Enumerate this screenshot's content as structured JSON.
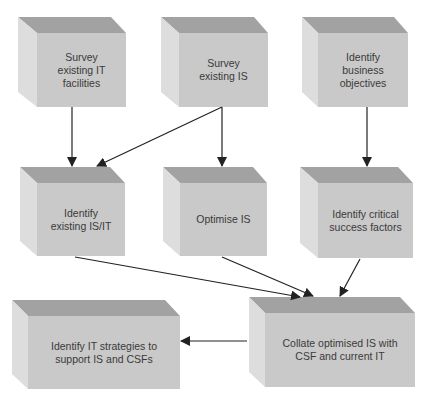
{
  "diagram": {
    "type": "flowchart",
    "style": {
      "top_face": "#a2a2a2",
      "left_face": "#dddddd",
      "front_face": "#c9c9c9",
      "arrow_color": "#222222",
      "text_color": "#3a3a3a"
    },
    "nodes": [
      {
        "id": "survey-it",
        "label": "Survey\nexisting IT\nfacilities",
        "row": 1,
        "col": 1
      },
      {
        "id": "survey-is",
        "label": "Survey\nexisting IS",
        "row": 1,
        "col": 2
      },
      {
        "id": "identify-objectives",
        "label": "Identify\nbusiness\nobjectives",
        "row": 1,
        "col": 3
      },
      {
        "id": "identify-existing",
        "label": "Identify\nexisting IS/IT",
        "row": 2,
        "col": 1
      },
      {
        "id": "optimise-is",
        "label": "Optimise IS",
        "row": 2,
        "col": 2
      },
      {
        "id": "identify-csf",
        "label": "Identify critical\nsuccess factors",
        "row": 2,
        "col": 3
      },
      {
        "id": "identify-strategies",
        "label": "Identify IT strategies to\nsupport IS and CSFs",
        "row": 3,
        "col": 1
      },
      {
        "id": "collate",
        "label": "Collate optimised IS with\nCSF and current IT",
        "row": 3,
        "col": 2
      }
    ],
    "edges": [
      {
        "from": "survey-it",
        "to": "identify-existing"
      },
      {
        "from": "survey-is",
        "to": "identify-existing"
      },
      {
        "from": "survey-is",
        "to": "optimise-is"
      },
      {
        "from": "identify-objectives",
        "to": "identify-csf"
      },
      {
        "from": "identify-existing",
        "to": "collate"
      },
      {
        "from": "optimise-is",
        "to": "collate"
      },
      {
        "from": "identify-csf",
        "to": "collate"
      },
      {
        "from": "collate",
        "to": "identify-strategies"
      }
    ]
  }
}
